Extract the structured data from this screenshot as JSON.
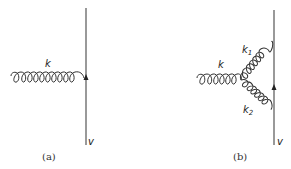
{
  "diagrams": [
    {
      "caption": "(a)",
      "gluon_label": "k",
      "line_label": "v"
    },
    {
      "caption": "(b)",
      "gluon_label": "k",
      "gluon_label_upper": "k",
      "gluon_label_upper_sub": "1",
      "gluon_label_lower": "k",
      "gluon_label_lower_sub": "2",
      "line_label": "v"
    }
  ],
  "colors": {
    "line": "#444444",
    "text": "#222222"
  }
}
